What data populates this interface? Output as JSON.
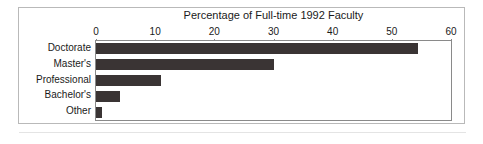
{
  "chart_data": {
    "type": "bar",
    "orientation": "horizontal",
    "title": "Percentage of Full-time 1992 Faculty",
    "xlabel": "",
    "ylabel": "",
    "categories": [
      "Doctorate",
      "Master's",
      "Professional",
      "Bachelor's",
      "Other"
    ],
    "values": [
      54.5,
      30,
      11,
      4,
      1
    ],
    "xlim": [
      0,
      60
    ],
    "xticks": [
      0,
      10,
      20,
      30,
      40,
      50,
      60
    ],
    "xticklabels": [
      "0",
      "10",
      "20",
      "30",
      "40",
      "50",
      "60"
    ],
    "grid": false,
    "legend": false,
    "bar_color": "#3a3434",
    "axis_color": "#8a8a8a",
    "frame_color": "#b9b9b9",
    "text_color": "#1a1a1a",
    "title_position": "top",
    "xaxis_position": "top"
  }
}
